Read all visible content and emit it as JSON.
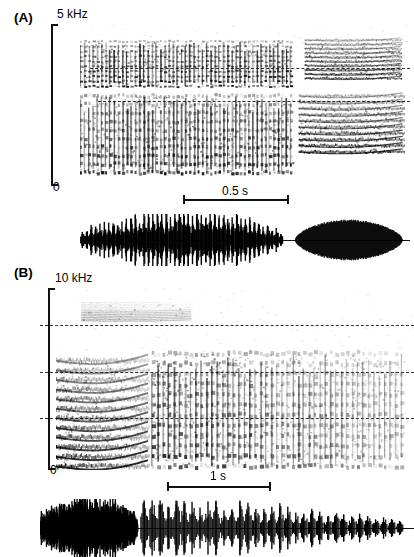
{
  "figure": {
    "background_color": "#ffffff",
    "ink_color": "#111111",
    "dash_color": "#333333"
  },
  "panels": [
    {
      "id": "A",
      "label": "(A)",
      "frequency_axis": {
        "top_label": "5 kHz",
        "bottom_label": "0",
        "max_khz": 5,
        "min_khz": 0
      },
      "time_scalebar": {
        "label": "0.5 s",
        "seconds": 0.5
      },
      "dashed_reference_lines_khz": [
        3.6,
        2.6
      ],
      "spectrogram_description": "Two stacked harmonic call stacks: a long pulsed broadband note followed by a short separate terminal note.",
      "waveform_description": "Amplitude-modulated pulse train followed by a shorter solid-envelope burst."
    },
    {
      "id": "B",
      "label": "(B)",
      "frequency_axis": {
        "top_label": "10 kHz",
        "bottom_label": "0",
        "max_khz": 10,
        "min_khz": 0
      },
      "time_scalebar": {
        "label": "1 s",
        "seconds": 1
      },
      "dashed_reference_lines_khz": [
        7.6,
        4.8,
        2.1
      ],
      "spectrogram_description": "Dense harmonic introductory segment followed by a long series of repeated broadband pulses that decline in energy.",
      "waveform_description": "Noisy dense introductory buzz followed by a long train of discrete decaying pulses."
    }
  ],
  "chart_data": {
    "type": "heatmap",
    "title": "",
    "panels": [
      {
        "id": "A",
        "panel_label": "(A)",
        "spectrogram": {
          "xlabel": "",
          "ylabel": "Frequency",
          "ylim": [
            0,
            5
          ],
          "ytick_labels": [
            "0",
            "5 kHz"
          ],
          "yticks": [
            0,
            5
          ],
          "time_scale_bar_seconds": 0.5,
          "time_scale_bar_label": "0.5 s",
          "dashed_lines_khz": [
            3.6,
            2.6
          ],
          "elements": [
            {
              "name": "upper-band-main-note",
              "t_start_s": 0.0,
              "t_end_s": 1.07,
              "f_low_khz": 3.05,
              "f_high_khz": 4.45,
              "character": "pulsed broadband"
            },
            {
              "name": "upper-band-terminal-note",
              "t_start_s": 1.13,
              "t_end_s": 1.62,
              "f_low_khz": 3.3,
              "f_high_khz": 4.5,
              "character": "tonal sweeps"
            },
            {
              "name": "lower-band-main-note",
              "t_start_s": 0.0,
              "t_end_s": 1.07,
              "f_low_khz": 0.35,
              "f_high_khz": 2.75,
              "character": "harmonic stack, pulsed"
            },
            {
              "name": "lower-band-terminal-note",
              "t_start_s": 1.1,
              "t_end_s": 1.63,
              "f_low_khz": 1.0,
              "f_high_khz": 2.75,
              "character": "tonal harmonics"
            }
          ]
        },
        "waveform": {
          "segments": [
            {
              "name": "pulse-train",
              "t_start_s": 0.0,
              "t_end_s": 1.02,
              "relative_peak_amplitude": 1.0,
              "pulse_count": 46
            },
            {
              "name": "terminal-burst",
              "t_start_s": 1.08,
              "t_end_s": 1.62,
              "relative_peak_amplitude": 0.78,
              "pulse_count": 1
            }
          ]
        }
      },
      {
        "id": "B",
        "panel_label": "(B)",
        "spectrogram": {
          "xlabel": "",
          "ylabel": "Frequency",
          "ylim": [
            0,
            10
          ],
          "ytick_labels": [
            "0",
            "10 kHz"
          ],
          "yticks": [
            0,
            10
          ],
          "time_scale_bar_seconds": 1,
          "time_scale_bar_label": "1 s",
          "dashed_lines_khz": [
            7.6,
            4.8,
            2.1
          ],
          "elements": [
            {
              "name": "introductory-harmonic-segment",
              "t_start_s": 0.0,
              "t_end_s": 0.92,
              "f_low_khz": 0.2,
              "f_high_khz": 6.0,
              "character": "dense harmonic stack"
            },
            {
              "name": "pulse-series",
              "t_start_s": 0.95,
              "t_end_s": 3.45,
              "f_low_khz": 0.2,
              "f_high_khz": 6.4,
              "character": "repeated broadband pulses, energy declining"
            },
            {
              "name": "high-frequency-trace",
              "t_start_s": 0.25,
              "t_end_s": 1.35,
              "f_low_khz": 8.2,
              "f_high_khz": 9.2,
              "character": "faint upper harmonics"
            }
          ]
        },
        "waveform": {
          "segments": [
            {
              "name": "introductory-buzz",
              "t_start_s": 0.0,
              "t_end_s": 0.92,
              "relative_peak_amplitude": 1.0,
              "pulse_count": 38
            },
            {
              "name": "pulse-train",
              "t_start_s": 0.95,
              "t_end_s": 3.45,
              "relative_peak_amplitude": 0.95,
              "pulse_count": 33
            }
          ]
        }
      }
    ]
  }
}
